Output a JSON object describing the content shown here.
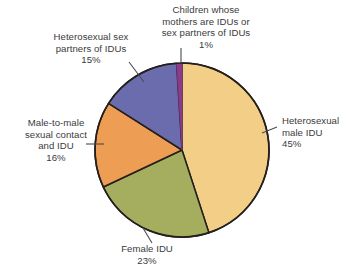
{
  "figure": {
    "background_color": "#ffffff",
    "text_color": "#3b3b40",
    "outline_color": "#241f1c",
    "leader_line_color": "#4a4a4f"
  },
  "labels": {
    "children": "Children whose\nmothers are IDUs or\nsex partners of IDUs\n1%",
    "heterosexual_sex_partners": "Heterosexual sex\npartners of IDUs\n15%",
    "male_to_male": "Male-to-male\nsexual contact\nand IDU\n16%",
    "heterosexual_male": "Heterosexual\nmale IDU\n45%",
    "female": "Female IDU\n23%"
  },
  "chart_data": {
    "type": "pie",
    "title": "",
    "legend": "none",
    "start_angle_deg": 0,
    "direction": "clockwise",
    "center": [
      182,
      150
    ],
    "radius": 87,
    "categories": [
      "Heterosexual male IDU",
      "Female IDU",
      "Male-to-male sexual contact and IDU",
      "Heterosexual sex partners of IDUs",
      "Children whose mothers are IDUs or sex partners of IDUs"
    ],
    "values": [
      45,
      23,
      16,
      15,
      1
    ],
    "value_labels": [
      "45%",
      "23%",
      "16%",
      "15%",
      "1%"
    ],
    "unit": "percent",
    "colors": [
      "#F2CE86",
      "#A5AD5E",
      "#EE9D54",
      "#6B6CAD",
      "#8B3A8C"
    ]
  }
}
